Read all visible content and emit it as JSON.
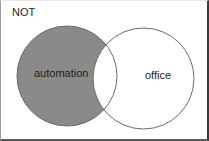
{
  "diagram": {
    "type": "venn",
    "operator_label": "NOT",
    "sets": [
      {
        "label": "automation",
        "shaded": true
      },
      {
        "label": "office",
        "shaded": false
      }
    ],
    "colors": {
      "shaded_fill": "#8a8a8a",
      "stroke": "#6a6a6a",
      "background": "#ffffff"
    }
  }
}
